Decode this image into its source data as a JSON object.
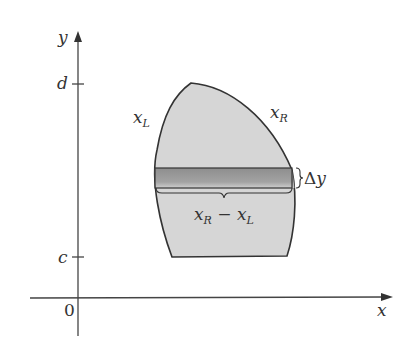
{
  "diagram": {
    "axes": {
      "y_label": "y",
      "x_label": "x",
      "origin_label": "0",
      "ticks": [
        {
          "label": "d",
          "position": "top"
        },
        {
          "label": "c",
          "position": "bottom"
        }
      ]
    },
    "curves": {
      "left": {
        "name": "x",
        "sub": "L"
      },
      "right": {
        "name": "x",
        "sub": "R"
      }
    },
    "strip": {
      "height_label_prefix": "Δ",
      "height_label_var": "y",
      "width_label": {
        "a": "x",
        "a_sub": "R",
        "op": " − ",
        "b": "x",
        "b_sub": "L"
      }
    },
    "colors": {
      "region_fill": "#d6d6d6",
      "strip_fill": "#9a9a9a",
      "outline": "#333333",
      "axis": "#444444"
    }
  }
}
